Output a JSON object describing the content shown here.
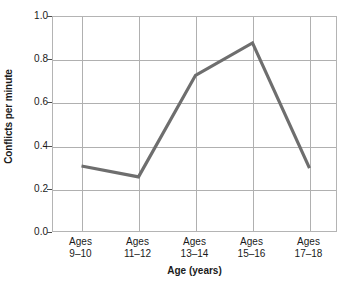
{
  "chart_data": {
    "type": "line",
    "title": "",
    "xlabel": "Age (years)",
    "ylabel": "Conflicts per minute",
    "categories": [
      "Ages\n9–10",
      "Ages\n11–12",
      "Ages\n13–14",
      "Ages\n15–16",
      "Ages\n17–18"
    ],
    "category_lines": [
      [
        "Ages",
        "9–10"
      ],
      [
        "Ages",
        "11–12"
      ],
      [
        "Ages",
        "13–14"
      ],
      [
        "Ages",
        "15–16"
      ],
      [
        "Ages",
        "17–18"
      ]
    ],
    "values": [
      0.31,
      0.26,
      0.73,
      0.88,
      0.3
    ],
    "ylim": [
      0.0,
      1.0
    ],
    "yticks": [
      "0.0",
      "0.2",
      "0.4",
      "0.6",
      "0.8",
      "1.0"
    ],
    "ytick_values": [
      0.0,
      0.2,
      0.4,
      0.6,
      0.8,
      1.0
    ],
    "grid": true,
    "legend": false,
    "legend_position": "none",
    "series": [
      {
        "name": "Conflicts per minute",
        "values": [
          0.31,
          0.26,
          0.73,
          0.88,
          0.3
        ],
        "color": "#6e6e6e",
        "line_width": 3.2,
        "markers": false
      }
    ],
    "colors": {
      "line": "#6e6e6e",
      "grid": "#b0b0b0",
      "frame": "#b4b4b4",
      "text": "#1a1a1a",
      "background": "#ffffff"
    }
  }
}
